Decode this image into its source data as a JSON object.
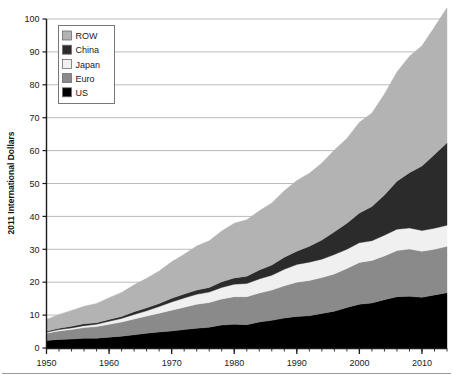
{
  "chart_data": {
    "type": "area",
    "stacked": true,
    "title": "",
    "xlabel": "",
    "ylabel": "2011 International Dollars",
    "xlim": [
      1950,
      2014
    ],
    "ylim": [
      0,
      100
    ],
    "ytick_step": 10,
    "xtick_step": 10,
    "x_minor_tick_step": 2,
    "grid": "horizontal",
    "legend_position": "top-left",
    "yticks": [
      "0",
      "10",
      "20",
      "30",
      "40",
      "50",
      "60",
      "70",
      "80",
      "90",
      "100"
    ],
    "xticks": [
      "1950",
      "1960",
      "1970",
      "1980",
      "1990",
      "2000",
      "2010"
    ],
    "x": [
      1950,
      1952,
      1954,
      1956,
      1958,
      1960,
      1962,
      1964,
      1966,
      1968,
      1970,
      1972,
      1974,
      1976,
      1978,
      1980,
      1982,
      1984,
      1986,
      1988,
      1990,
      1992,
      1994,
      1996,
      1998,
      2000,
      2002,
      2004,
      2006,
      2008,
      2010,
      2012,
      2014
    ],
    "series": [
      {
        "name": "US",
        "color": "#000000",
        "values": [
          2.3,
          2.6,
          2.7,
          3.0,
          3.0,
          3.3,
          3.6,
          4.0,
          4.5,
          4.9,
          5.2,
          5.6,
          6.0,
          6.3,
          7.0,
          7.2,
          7.1,
          7.9,
          8.4,
          9.1,
          9.6,
          9.8,
          10.5,
          11.2,
          12.3,
          13.3,
          13.7,
          14.7,
          15.6,
          15.7,
          15.4,
          16.1,
          16.8
        ]
      },
      {
        "name": "Euro",
        "color": "#8a8a8a",
        "values": [
          2.2,
          2.6,
          2.9,
          3.2,
          3.5,
          3.9,
          4.3,
          4.8,
          5.2,
          5.7,
          6.3,
          6.8,
          7.3,
          7.5,
          7.9,
          8.4,
          8.5,
          8.8,
          9.2,
          9.8,
          10.4,
          10.7,
          10.9,
          11.3,
          11.9,
          12.7,
          12.9,
          13.3,
          14.0,
          14.4,
          14.0,
          13.9,
          14.1
        ]
      },
      {
        "name": "Japan",
        "color": "#f0f0f0",
        "values": [
          0.3,
          0.4,
          0.5,
          0.6,
          0.7,
          0.9,
          1.1,
          1.4,
          1.6,
          2.0,
          2.5,
          2.8,
          3.0,
          3.2,
          3.5,
          3.8,
          4.0,
          4.3,
          4.5,
          5.0,
          5.4,
          5.6,
          5.6,
          5.9,
          5.8,
          6.0,
          6.0,
          6.3,
          6.5,
          6.4,
          6.3,
          6.4,
          6.4
        ]
      },
      {
        "name": "China",
        "color": "#2b2b2b",
        "values": [
          0.3,
          0.4,
          0.5,
          0.6,
          0.5,
          0.6,
          0.6,
          0.8,
          0.9,
          0.9,
          1.1,
          1.2,
          1.3,
          1.4,
          1.7,
          1.9,
          2.2,
          2.7,
          3.1,
          3.7,
          4.0,
          4.8,
          5.8,
          6.9,
          7.9,
          9.0,
          10.4,
          12.2,
          14.6,
          16.8,
          19.6,
          22.4,
          25.1
        ]
      },
      {
        "name": "ROW",
        "color": "#b3b3b3",
        "values": [
          3.6,
          4.2,
          4.8,
          5.3,
          5.8,
          6.6,
          7.3,
          8.2,
          9.0,
          9.9,
          11.1,
          12.1,
          13.4,
          14.2,
          15.5,
          16.6,
          17.2,
          18.0,
          18.9,
          20.2,
          21.5,
          22.2,
          23.4,
          24.9,
          25.8,
          27.6,
          28.4,
          30.7,
          33.2,
          35.4,
          36.6,
          38.8,
          41.0
        ]
      }
    ],
    "legend_entries": [
      {
        "label": "ROW",
        "color": "#b3b3b3"
      },
      {
        "label": "China",
        "color": "#2b2b2b"
      },
      {
        "label": "Japan",
        "color": "#f0f0f0"
      },
      {
        "label": "Euro",
        "color": "#8a8a8a"
      },
      {
        "label": "US",
        "color": "#000000"
      }
    ]
  },
  "axis": {
    "ylabel": "2011 International Dollars"
  },
  "caption": {
    "text": ""
  }
}
